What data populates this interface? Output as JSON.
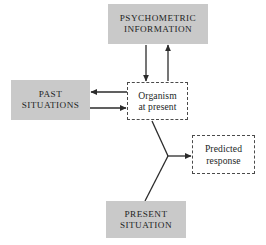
{
  "diagram": {
    "title_present": false,
    "background_color": "#ffffff",
    "box_fill_color": "#c9c9c9",
    "line_color": "#2b2b2b",
    "nodes": [
      {
        "id": "psychometric",
        "label": "PSYCHOMETRIC\nINFORMATION",
        "style": "filled",
        "x": 108,
        "y": 4,
        "width": 100,
        "height": 40
      },
      {
        "id": "past",
        "label": "PAST\nSITUATIONS",
        "style": "filled",
        "x": 11,
        "y": 80,
        "width": 79,
        "height": 40
      },
      {
        "id": "organism",
        "label": "Organism\nat present",
        "style": "dashed",
        "x": 127,
        "y": 82,
        "width": 61,
        "height": 38
      },
      {
        "id": "predicted",
        "label": "Predicted\nresponse",
        "style": "dashed",
        "x": 192,
        "y": 135,
        "width": 63,
        "height": 39
      },
      {
        "id": "present",
        "label": "PRESENT\nSITUATION",
        "style": "filled",
        "x": 106,
        "y": 201,
        "width": 80,
        "height": 37
      }
    ],
    "edges": [
      {
        "id": "psychometric-to-organism",
        "from": "psychometric",
        "to": "organism",
        "arrow": "down"
      },
      {
        "id": "organism-to-psychometric",
        "from": "organism",
        "to": "psychometric",
        "arrow": "up"
      },
      {
        "id": "organism-to-past",
        "from": "organism",
        "to": "past",
        "arrow": "left"
      },
      {
        "id": "past-to-organism",
        "from": "past",
        "to": "organism",
        "arrow": "right"
      },
      {
        "id": "organism-to-predicted",
        "from": "organism",
        "to": "predicted",
        "arrow": "right"
      },
      {
        "id": "present-to-predicted",
        "from": "present",
        "to": "predicted",
        "arrow": "right"
      }
    ]
  }
}
